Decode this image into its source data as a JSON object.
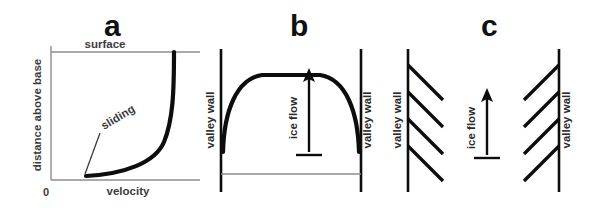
{
  "figure": {
    "width": 600,
    "height": 208,
    "background_color": "#ffffff",
    "ink_color": "#0d0d0d",
    "axis_color": "#8d8d8d",
    "text_color": "#3b3b3b"
  },
  "panels": [
    {
      "id": "a",
      "letter": "a",
      "kind": "cross-section-velocity-profile",
      "description": "Vertical velocity profile of glacier ice showing internal deformation plus basal sliding",
      "axes": {
        "y_label": "distance above base",
        "x_label": "velocity",
        "origin_label": "0",
        "top_label": "surface"
      },
      "annotations": [
        {
          "label": "sliding",
          "points_to": "basal offset of the velocity curve at the bed"
        }
      ],
      "curve": {
        "name": "velocity-profile-curve",
        "shape": "near-vertical at surface, bending sharply to near-horizontal at base, offset from zero at the bed"
      }
    },
    {
      "id": "b",
      "letter": "b",
      "kind": "plan-view-velocity-profile",
      "description": "Map view of a valley glacier: velocity is greatest at the centre line and decreases toward the valley walls",
      "labels": {
        "left_wall": "valley wall",
        "right_wall": "valley wall",
        "flow": "ice flow"
      },
      "curve": {
        "name": "plan-velocity-profile-curve",
        "shape": "broad plateau across the centre, dropping steeply to near zero at both valley walls"
      },
      "arrow": {
        "name": "ice-flow-arrow",
        "direction": "up"
      }
    },
    {
      "id": "c",
      "letter": "c",
      "kind": "plan-view-crevasse-pattern",
      "description": "Map view showing marginal crevasses opening at roughly 45 degrees to the valley walls, pointing up-glacier",
      "labels": {
        "left_wall": "valley wall",
        "right_wall": "valley wall",
        "flow": "ice flow"
      },
      "arrow": {
        "name": "ice-flow-arrow",
        "direction": "up"
      },
      "crevasses": {
        "left_count": 4,
        "right_count": 4,
        "angle_degrees": 45,
        "left_orientation": "down-glacier toward the centre (from wall, sloping down-right)",
        "right_orientation": "down-glacier toward the centre (from wall, sloping down-left)"
      }
    }
  ]
}
